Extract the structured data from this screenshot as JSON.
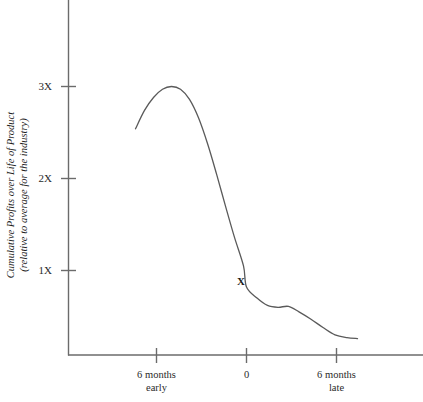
{
  "chart_data": {
    "type": "line",
    "title": "",
    "subtitle": "",
    "ylabel_line1": "Cumulative Profits over Life of Product",
    "ylabel_line2": "(relative to average for the industry)",
    "xlabel": "",
    "grid": false,
    "legend": "none",
    "ylim": [
      0,
      3.6
    ],
    "xlim": [
      -9,
      12
    ],
    "y_ticks": [
      {
        "value": 1,
        "label": "1X"
      },
      {
        "value": 2,
        "label": "2X"
      },
      {
        "value": 3,
        "label": "3X"
      }
    ],
    "x_ticks": [
      {
        "value": -6,
        "label_line1": "6 months",
        "label_line2": "early"
      },
      {
        "value": 0,
        "label_line1": "0",
        "label_line2": ""
      },
      {
        "value": 6,
        "label_line1": "6 months",
        "label_line2": "late"
      }
    ],
    "annotations": [
      {
        "name": "on-time-marker",
        "label": "X",
        "x": 0,
        "y": 0.82
      }
    ],
    "series": [
      {
        "name": "Cumulative profits",
        "points": [
          {
            "x": -7.4,
            "y": 2.54
          },
          {
            "x": -6.8,
            "y": 2.74
          },
          {
            "x": -6.2,
            "y": 2.88
          },
          {
            "x": -5.6,
            "y": 2.97
          },
          {
            "x": -5.0,
            "y": 3.0
          },
          {
            "x": -4.4,
            "y": 2.97
          },
          {
            "x": -3.8,
            "y": 2.86
          },
          {
            "x": -3.2,
            "y": 2.66
          },
          {
            "x": -2.6,
            "y": 2.38
          },
          {
            "x": -2.0,
            "y": 2.05
          },
          {
            "x": -1.4,
            "y": 1.7
          },
          {
            "x": -0.8,
            "y": 1.36
          },
          {
            "x": -0.2,
            "y": 1.05
          },
          {
            "x": 0.0,
            "y": 0.82
          },
          {
            "x": 0.7,
            "y": 0.7
          },
          {
            "x": 1.4,
            "y": 0.62
          },
          {
            "x": 2.1,
            "y": 0.6
          },
          {
            "x": 2.8,
            "y": 0.61
          },
          {
            "x": 3.5,
            "y": 0.55
          },
          {
            "x": 4.3,
            "y": 0.47
          },
          {
            "x": 5.1,
            "y": 0.38
          },
          {
            "x": 5.9,
            "y": 0.3
          },
          {
            "x": 6.7,
            "y": 0.27
          },
          {
            "x": 7.4,
            "y": 0.26
          }
        ]
      }
    ],
    "colors": {
      "background": "#ffffff",
      "axis": "#6b6b6b",
      "curve": "#5a5a5a",
      "text": "#2a2a2a"
    }
  }
}
